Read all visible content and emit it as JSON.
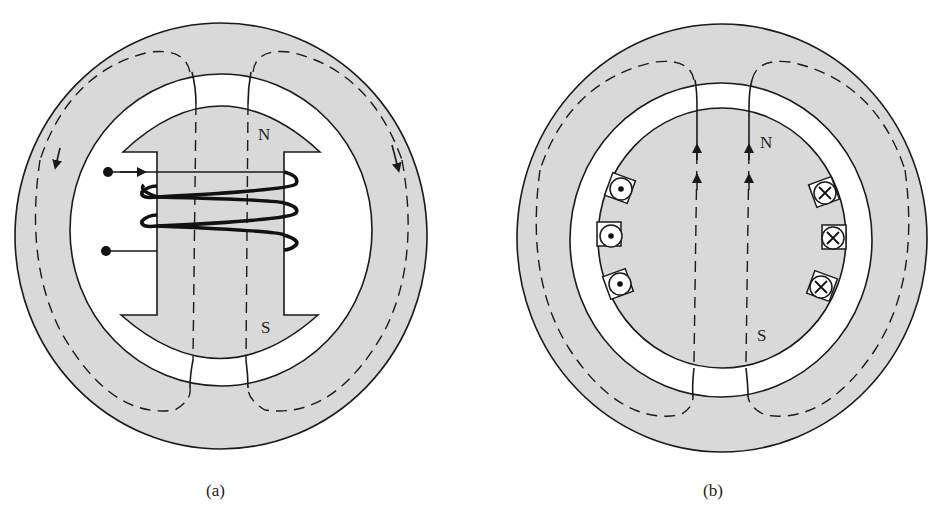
{
  "figure": {
    "panels": [
      {
        "id": "a",
        "caption": "(a)",
        "description": "Salient-pole rotor with field winding inside stator",
        "pole_labels": {
          "north": "N",
          "south": "S"
        }
      },
      {
        "id": "b",
        "caption": "(b)",
        "description": "Cylindrical (round) rotor with distributed slot conductors inside stator",
        "pole_labels": {
          "north": "N",
          "south": "S"
        },
        "left_conductors_symbol": "dot (current out of page)",
        "right_conductors_symbol": "cross (current into page)",
        "left_conductor_count": 3,
        "right_conductor_count": 3
      }
    ],
    "colors": {
      "iron": "#d9d9d9",
      "outline": "#1a1a1a",
      "air_gap": "#ffffff"
    }
  }
}
